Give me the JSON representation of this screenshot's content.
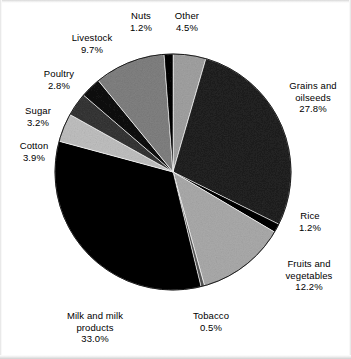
{
  "chart_data": {
    "type": "pie",
    "title": "",
    "subtitle": "",
    "xlabel": "",
    "ylabel": "",
    "legend_position": "none",
    "grid": false,
    "units": "percent",
    "total": 100.0,
    "start_angle_deg": -90,
    "direction": "clockwise",
    "categories": [
      "Other",
      "Grains and oilseeds",
      "Rice",
      "Fruits and vegetables",
      "Tobacco",
      "Milk and milk products",
      "Cotton",
      "Sugar",
      "Poultry",
      "Livestock",
      "Nuts"
    ],
    "values": [
      4.5,
      27.8,
      1.2,
      12.2,
      0.5,
      33.0,
      3.9,
      3.2,
      2.8,
      9.7,
      1.2
    ],
    "slices": [
      {
        "label": "Other",
        "value": 4.5,
        "display": "4.5%",
        "color": "#c9c9c9"
      },
      {
        "label": "Grains and oilseeds",
        "value": 27.8,
        "display": "27.8%",
        "color": "#565656"
      },
      {
        "label": "Rice",
        "value": 1.2,
        "display": "1.2%",
        "color": "#1c1c1c"
      },
      {
        "label": "Fruits and vegetables",
        "value": 12.2,
        "display": "12.2%",
        "color": "#cfcfcf"
      },
      {
        "label": "Tobacco",
        "value": 0.5,
        "display": "0.5%",
        "color": "#8f8f8f"
      },
      {
        "label": "Milk and milk products",
        "value": 33.0,
        "display": "33.0%",
        "color": "#1a1a1a"
      },
      {
        "label": "Cotton",
        "value": 3.9,
        "display": "3.9%",
        "color": "#dcdcdc"
      },
      {
        "label": "Sugar",
        "value": 3.2,
        "display": "3.2%",
        "color": "#707070"
      },
      {
        "label": "Poultry",
        "value": 2.8,
        "display": "2.8%",
        "color": "#3a3a3a"
      },
      {
        "label": "Livestock",
        "value": 9.7,
        "display": "9.7%",
        "color": "#b2b2b2"
      },
      {
        "label": "Nuts",
        "value": 1.2,
        "display": "1.2%",
        "color": "#202020"
      }
    ],
    "geometry": {
      "cx": 173,
      "cy": 172,
      "r": 118
    }
  },
  "labels": [
    {
      "key": "nuts",
      "name": "Nuts",
      "pct": "1.2%",
      "x": 120,
      "y": 10,
      "w": 42,
      "align": "center"
    },
    {
      "key": "other",
      "name": "Other",
      "pct": "4.5%",
      "x": 164,
      "y": 10,
      "w": 46,
      "align": "center"
    },
    {
      "key": "livestock",
      "name": "Livestock",
      "pct": "9.7%",
      "x": 62,
      "y": 32,
      "w": 60,
      "align": "center"
    },
    {
      "key": "poultry",
      "name": "Poultry",
      "pct": "2.8%",
      "x": 32,
      "y": 68,
      "w": 54,
      "align": "center"
    },
    {
      "key": "sugar",
      "name": "Sugar",
      "pct": "3.2%",
      "x": 12,
      "y": 105,
      "w": 52,
      "align": "center"
    },
    {
      "key": "cotton",
      "name": "Cotton",
      "pct": "3.9%",
      "x": 7,
      "y": 140,
      "w": 54,
      "align": "center"
    },
    {
      "key": "grains",
      "name": "Grains and\noilseeds",
      "pct": "27.8%",
      "x": 278,
      "y": 80,
      "w": 70,
      "align": "center"
    },
    {
      "key": "rice",
      "name": "Rice",
      "pct": "1.2%",
      "x": 288,
      "y": 210,
      "w": 44,
      "align": "center"
    },
    {
      "key": "fruits",
      "name": "Fruits and\nvegetables",
      "pct": "12.2%",
      "x": 272,
      "y": 258,
      "w": 74,
      "align": "center"
    },
    {
      "key": "tobacco",
      "name": "Tobacco",
      "pct": "0.5%",
      "x": 182,
      "y": 310,
      "w": 58,
      "align": "center"
    },
    {
      "key": "milk",
      "name": "Milk and milk\nproducts",
      "pct": "33.0%",
      "x": 50,
      "y": 310,
      "w": 90,
      "align": "center"
    }
  ]
}
